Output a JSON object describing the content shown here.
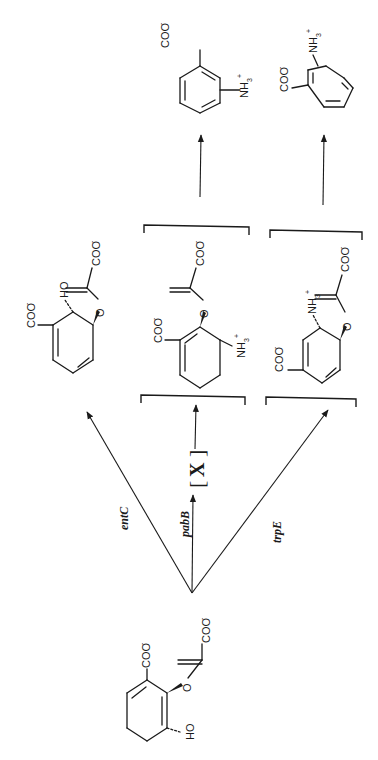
{
  "diagram": {
    "title": "",
    "orientation": "rotated-90-ccw",
    "labels": {
      "carboxylate": "COO",
      "carboxylate_charge": "-",
      "ammonium": "NH",
      "ammonium_sub": "3",
      "ammonium_charge": "+",
      "hydroxyl_oh": "OH",
      "hydroxyl_ho": "HO",
      "oxygen": "O"
    },
    "enzymes": [
      {
        "id": "entC",
        "label": "entC"
      },
      {
        "id": "pabB",
        "label": "pabB"
      },
      {
        "id": "trpE",
        "label": "trpE"
      }
    ],
    "intermediate_x": {
      "label": "X",
      "bracket_open": "[",
      "bracket_close": "]"
    },
    "molecules": [
      {
        "id": "chorismate",
        "role": "substrate",
        "groups": [
          "COO-",
          "O-enolpyruvyl COO-",
          "OH"
        ]
      },
      {
        "id": "isochorismate",
        "role": "entC product",
        "groups": [
          "COO-",
          "OH",
          "O-enolpyruvyl COO-"
        ]
      },
      {
        "id": "aminodeoxychorismate",
        "role": "pabB product (bracketed)",
        "groups": [
          "COO-",
          "NH3+",
          "O-enolpyruvyl COO-"
        ]
      },
      {
        "id": "aminodeoxyisochorismate",
        "role": "trpE intermediate (bracketed)",
        "groups": [
          "COO-",
          "NH3+",
          "O-enolpyruvyl COO-"
        ]
      },
      {
        "id": "p-aminobenzoate",
        "role": "final product",
        "groups": [
          "COO-",
          "NH3+"
        ]
      },
      {
        "id": "anthranilate",
        "role": "final product",
        "groups": [
          "COO-",
          "NH3+"
        ]
      }
    ]
  }
}
